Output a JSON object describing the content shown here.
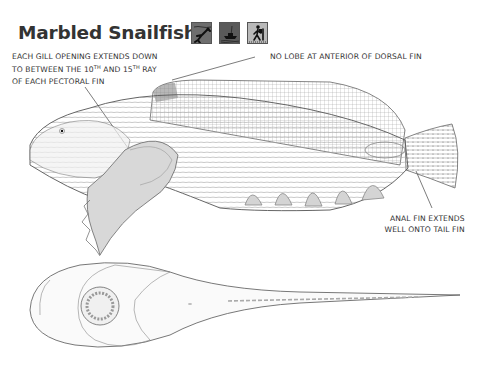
{
  "page": {
    "title": "Marbled Snailfish",
    "habitat_icons": [
      {
        "name": "diving-icon",
        "label": "Diver",
        "bg": "#6e6e6e"
      },
      {
        "name": "boat-icon",
        "label": "Boat",
        "bg": "#5a5a5a"
      },
      {
        "name": "shore-walker-icon",
        "label": "Shore walker",
        "bg": "#b9b9b9"
      }
    ],
    "annotations": {
      "gill": {
        "line1": "EACH GILL OPENING EXTENDS DOWN",
        "line2_a": "TO BETWEEN THE 10",
        "line2_sup1": "TH",
        "line2_b": " AND 15",
        "line2_sup2": "TH",
        "line2_c": " RAY",
        "line3": "OF EACH PECTORAL FIN"
      },
      "dorsal": "NO LOBE AT ANTERIOR OF DORSAL FIN",
      "anal_line1": "ANAL FIN EXTENDS",
      "anal_line2": "WELL ONTO TAIL FIN"
    },
    "illustrations": {
      "lateral": "marbled-snailfish-side-view",
      "ventral": "marbled-snailfish-ventral-view"
    }
  }
}
